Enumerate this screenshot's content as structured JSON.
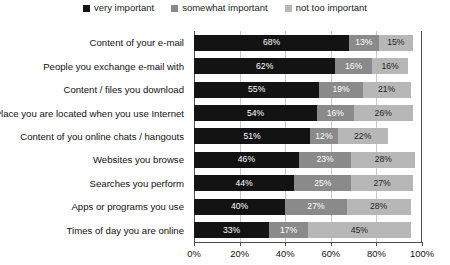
{
  "chart_data": {
    "type": "bar",
    "subtype": "horizontal-stacked-100",
    "title": "",
    "xlabel": "",
    "ylabel": "",
    "xlim": [
      0,
      100
    ],
    "grid": true,
    "legend_position": "top-center",
    "xticks": [
      "0%",
      "20%",
      "40%",
      "60%",
      "80%",
      "100%"
    ],
    "xtick_values": [
      0,
      20,
      40,
      60,
      80,
      100
    ],
    "categories": [
      "Content of your e-mail",
      "People you exchange e-mail with",
      "Content / files you download",
      "Place you are located when you use Internet",
      "Content of you online chats / hangouts",
      "Websites you browse",
      "Searches you perform",
      "Apps or programs you use",
      "Times of day you are online"
    ],
    "series": [
      {
        "name": "very important",
        "color": "#131313",
        "values": [
          68,
          62,
          55,
          54,
          51,
          46,
          44,
          40,
          33
        ],
        "labels": [
          "68%",
          "62%",
          "55%",
          "54%",
          "51%",
          "46%",
          "44%",
          "40%",
          "33%"
        ]
      },
      {
        "name": "somewhat important",
        "color": "#8a8a8a",
        "values": [
          13,
          16,
          19,
          16,
          12,
          23,
          25,
          27,
          17
        ],
        "labels": [
          "13%",
          "16%",
          "19%",
          "16%",
          "12%",
          "23%",
          "25%",
          "27%",
          "17%"
        ]
      },
      {
        "name": "not too important",
        "color": "#b7b7b7",
        "values": [
          15,
          16,
          21,
          26,
          22,
          28,
          27,
          28,
          45
        ],
        "labels": [
          "15%",
          "16%",
          "21%",
          "26%",
          "22%",
          "28%",
          "27%",
          "28%",
          "45%"
        ]
      }
    ]
  }
}
